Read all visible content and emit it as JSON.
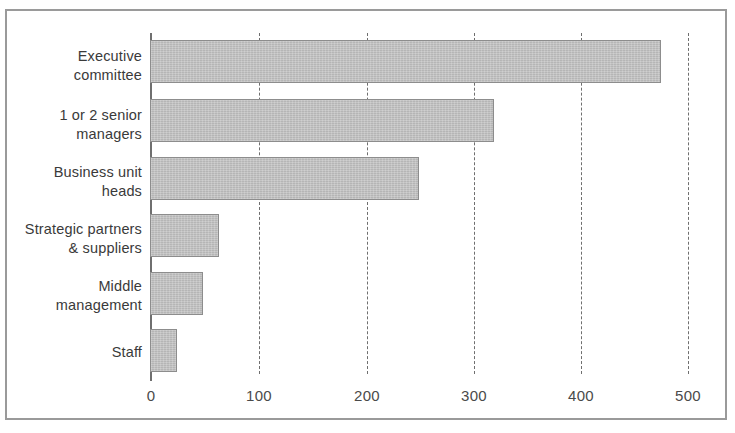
{
  "chart_data": {
    "type": "bar",
    "orientation": "horizontal",
    "title": "",
    "xlabel": "",
    "ylabel": "",
    "xlim": [
      0,
      500
    ],
    "xticks": [
      0,
      100,
      200,
      300,
      400,
      500
    ],
    "xtick_labels": [
      "0",
      "100",
      "200",
      "300",
      "400",
      "500"
    ],
    "grid": "vertical dashed gridlines at each x tick",
    "legend": "none",
    "bar_color": "#bcbcbc",
    "bar_edge_color": "#8d8d8d",
    "axis_color": "#6f6f6f",
    "frame_color": "#9a9a9a",
    "categories": [
      "Executive committee",
      "1 or 2 senior managers",
      "Business unit heads",
      "Strategic partners & suppliers",
      "Middle management",
      "Staff"
    ],
    "values": [
      476,
      320,
      250,
      64,
      49,
      25
    ]
  },
  "axis": {
    "ticks": [
      {
        "label": "0",
        "value": 0
      },
      {
        "label": "100",
        "value": 100
      },
      {
        "label": "200",
        "value": 200
      },
      {
        "label": "300",
        "value": 300
      },
      {
        "label": "400",
        "value": 400
      },
      {
        "label": "500",
        "value": 500
      }
    ]
  },
  "bars": [
    {
      "label_line1": "Executive",
      "label_line2": "committee",
      "value": 476
    },
    {
      "label_line1": "1 or 2 senior",
      "label_line2": "managers",
      "value": 320
    },
    {
      "label_line1": "Business unit",
      "label_line2": "heads",
      "value": 250
    },
    {
      "label_line1": "Strategic partners",
      "label_line2": "& suppliers",
      "value": 64
    },
    {
      "label_line1": "Middle",
      "label_line2": "management",
      "value": 49
    },
    {
      "label_line1": "Staff",
      "label_line2": "",
      "value": 25
    }
  ]
}
